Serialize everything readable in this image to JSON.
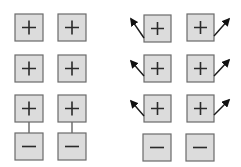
{
  "diagram": {
    "title": "",
    "colors": {
      "box_fill": "#dcdcdc",
      "box_stroke": "#6a6a6a",
      "symbol": "#2a2a2a",
      "arrow": "#111111"
    },
    "left_panel": {
      "description": "Stack of charge boxes; bottom positive box in each column connected to a negative box below",
      "columns": [
        {
          "boxes": [
            "+",
            "+",
            "+",
            "−"
          ],
          "connected_pair": [
            2,
            3
          ]
        },
        {
          "boxes": [
            "+",
            "+",
            "+",
            "−"
          ],
          "connected_pair": [
            2,
            3
          ]
        }
      ]
    },
    "right_panel": {
      "description": "Positive boxes emit outward arrows; negative boxes at bottom are unconnected",
      "columns": [
        {
          "boxes": [
            "+",
            "+",
            "+",
            "−"
          ],
          "arrow_direction": "up-left"
        },
        {
          "boxes": [
            "+",
            "+",
            "+",
            "−"
          ],
          "arrow_direction": "up-right"
        }
      ]
    }
  }
}
